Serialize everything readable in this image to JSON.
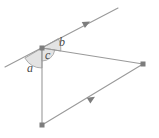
{
  "figure": {
    "background_color": "#ffffff",
    "stroke_color": "#9a9a9a",
    "arc_fill_color": "#e3e3e3",
    "arc_stroke_color": "#9a9a9a",
    "label_color": "#4a4a4a",
    "vertex_color": "#7d7d7d",
    "width": 159,
    "height": 138
  },
  "labels": {
    "a": "a",
    "b": "b",
    "c": "c"
  },
  "vertices": [
    {
      "name": "apex",
      "x": 42,
      "y": 48
    },
    {
      "name": "right",
      "x": 143,
      "y": 64
    },
    {
      "name": "bottom",
      "x": 42,
      "y": 125
    }
  ],
  "lines": [
    {
      "name": "transversal",
      "from": {
        "x": 5,
        "y": 67
      },
      "to": {
        "x": 118,
        "y": 8
      },
      "marker": "single-arrow",
      "marker_at": {
        "x": 88,
        "y": 23
      }
    },
    {
      "name": "triangle-left-side",
      "from": {
        "x": 42,
        "y": 48
      },
      "to": {
        "x": 42,
        "y": 125
      },
      "marker": "none"
    },
    {
      "name": "triangle-right-side",
      "from": {
        "x": 42,
        "y": 48
      },
      "to": {
        "x": 143,
        "y": 64
      },
      "marker": "none"
    },
    {
      "name": "triangle-bottom-side",
      "from": {
        "x": 42,
        "y": 125
      },
      "to": {
        "x": 143,
        "y": 64
      },
      "marker": "single-arrow",
      "marker_at": {
        "x": 93,
        "y": 98
      }
    }
  ],
  "angles": [
    {
      "name": "angle-a",
      "label": "a",
      "vertex": "apex",
      "position": "lower-left",
      "arc_radius": 20
    },
    {
      "name": "angle-b",
      "label": "b",
      "vertex": "apex",
      "position": "upper-right",
      "arc_radius": 19
    },
    {
      "name": "angle-c",
      "label": "c",
      "vertex": "apex",
      "position": "interior",
      "arc_radius": 13
    }
  ]
}
